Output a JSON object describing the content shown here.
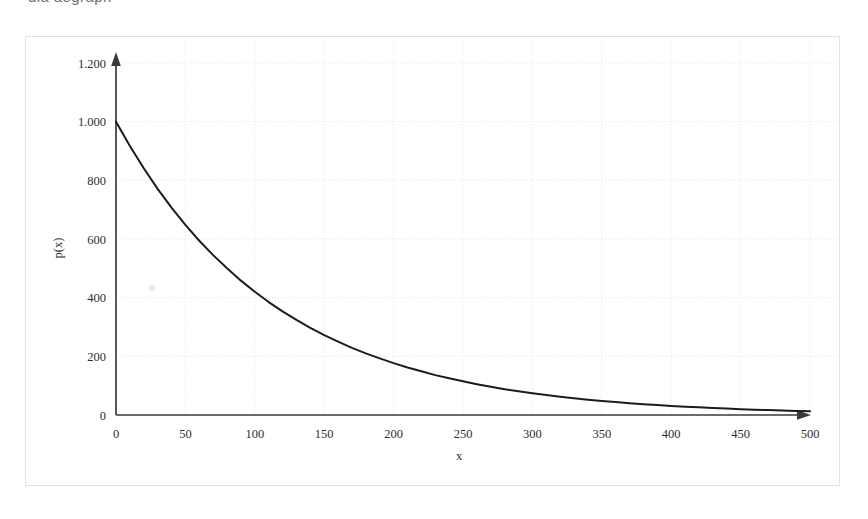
{
  "document": {
    "clipped_top_text": "dia  aegrapn"
  },
  "chart_data": {
    "type": "line",
    "title": "",
    "subtitle": "",
    "xlabel": "x",
    "ylabel": "p(x)",
    "xlim": [
      0,
      500
    ],
    "ylim": [
      0,
      1200
    ],
    "x_ticks": [
      0,
      50,
      100,
      150,
      200,
      250,
      300,
      350,
      400,
      450,
      500
    ],
    "x_tick_labels": [
      "0",
      "50",
      "100",
      "150",
      "200",
      "250",
      "300",
      "350",
      "400",
      "450",
      "500"
    ],
    "y_ticks": [
      0,
      200,
      400,
      600,
      800,
      1000,
      1200
    ],
    "y_tick_labels": [
      "0",
      "200",
      "400",
      "600",
      "800",
      "1.000",
      "1.200"
    ],
    "grid": true,
    "legend": false,
    "legend_position": "none",
    "axis_style": "arrow-tipped",
    "series": [
      {
        "name": "p(x)",
        "color": "#1c1c1c",
        "formula": "p(x) = 1000 * exp(-x / 115)",
        "x": [
          0,
          10,
          20,
          30,
          40,
          50,
          60,
          70,
          80,
          90,
          100,
          110,
          120,
          130,
          140,
          150,
          160,
          170,
          180,
          190,
          200,
          210,
          220,
          230,
          240,
          250,
          260,
          270,
          280,
          290,
          300,
          310,
          320,
          330,
          340,
          350,
          360,
          370,
          380,
          390,
          400,
          410,
          420,
          430,
          440,
          450,
          460,
          470,
          480,
          490,
          500
        ],
        "values": [
          1000,
          917,
          841,
          771,
          707,
          648,
          594,
          545,
          500,
          458,
          420,
          385,
          353,
          324,
          297,
          272,
          250,
          229,
          210,
          193,
          177,
          162,
          149,
          136,
          125,
          115,
          105,
          96,
          88,
          81,
          74,
          68,
          62,
          57,
          52,
          48,
          44,
          40,
          37,
          34,
          31,
          28,
          26,
          24,
          22,
          20,
          18,
          17,
          15,
          14,
          13
        ]
      }
    ]
  }
}
